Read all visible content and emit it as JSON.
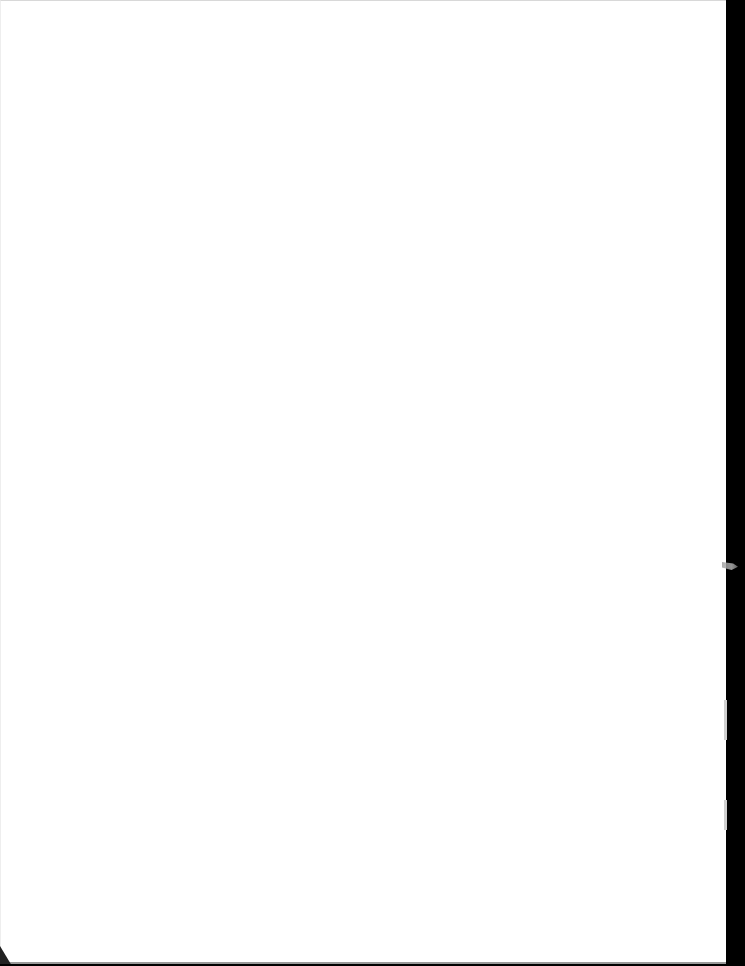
{
  "document": {
    "type": "scanned-page",
    "content": "blank",
    "visible_text": [],
    "bleed_through": {
      "top_left": "",
      "top_right": ""
    }
  },
  "colors": {
    "page": "#ffffff",
    "scan_border": "#000000"
  }
}
